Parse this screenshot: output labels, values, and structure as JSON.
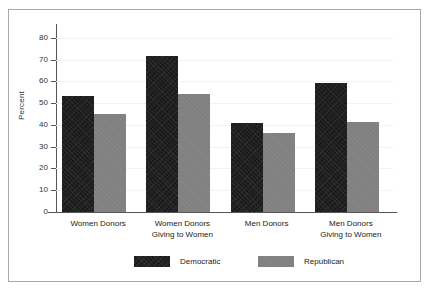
{
  "chart_data": {
    "type": "bar",
    "title": "",
    "xlabel": "",
    "ylabel": "Percent",
    "ylim": [
      0,
      85
    ],
    "yticks": [
      0,
      10,
      20,
      30,
      40,
      50,
      60,
      70,
      80
    ],
    "ytick_labels": [
      "0",
      "10",
      "20",
      "30",
      "40",
      "50",
      "60",
      "70",
      "80"
    ],
    "grid": true,
    "legend_position": "bottom",
    "categories": [
      "Women Donors",
      "Women Donors\nGiving to Women",
      "Men Donors",
      "Men Donors\nGiving to Women"
    ],
    "series": [
      {
        "name": "Democratic",
        "color": "#1b1b1b",
        "values": [
          53.5,
          71.8,
          41.0,
          59.5
        ]
      },
      {
        "name": "Republican",
        "color": "#808080",
        "values": [
          45.2,
          54.4,
          36.5,
          41.3
        ]
      }
    ]
  },
  "axis": {
    "y_title": "Percent"
  },
  "legend": {
    "items": [
      {
        "label": "Democratic",
        "swatch": "dark-pattern-swatch"
      },
      {
        "label": "Republican",
        "swatch": "gray-swatch"
      }
    ]
  }
}
